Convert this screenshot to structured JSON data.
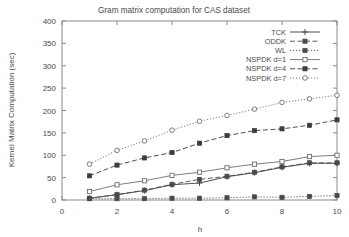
{
  "chart_data": {
    "type": "line",
    "title": "Gram matrix computation for CAS dataset",
    "xlabel": "h",
    "ylabel": "Kernel Matrix Computation (sec)",
    "xlim": [
      0,
      10
    ],
    "ylim": [
      0,
      400
    ],
    "xticks": [
      0,
      2,
      4,
      6,
      8,
      10
    ],
    "yticks": [
      0,
      50,
      100,
      150,
      200,
      250,
      300,
      350,
      400
    ],
    "xtick_labels": [
      "0",
      "2",
      "4",
      "6",
      "8",
      "10"
    ],
    "ytick_labels": [
      "0",
      "50",
      "100",
      "150",
      "200",
      "250",
      "300",
      "350",
      "400"
    ],
    "grid": false,
    "legend_position": "upper right inside",
    "x": [
      1,
      2,
      3,
      4,
      5,
      6,
      7,
      8,
      9,
      10
    ],
    "series": [
      {
        "name": "TCK",
        "marker": "plus",
        "line": "solid",
        "color": "#3c3c3c",
        "values": [
          4,
          12,
          21,
          34,
          38,
          52,
          61,
          73,
          82,
          82
        ]
      },
      {
        "name": "ODDK",
        "marker": "filled-square",
        "line": "dashed",
        "color": "#4a4a4a",
        "values": [
          4,
          12,
          22,
          35,
          46,
          53,
          62,
          74,
          83,
          83
        ]
      },
      {
        "name": "WL",
        "marker": "filled-square",
        "line": "dotted",
        "color": "#4a4a4a",
        "values": [
          3,
          3,
          3,
          4,
          4,
          5,
          7,
          6,
          8,
          10
        ]
      },
      {
        "name": "NSPDK d=1",
        "marker": "open-square",
        "line": "solid",
        "color": "#6e6e6e",
        "values": [
          19,
          34,
          43,
          55,
          62,
          72,
          80,
          86,
          97,
          100
        ]
      },
      {
        "name": "NSPDK d=4",
        "marker": "filled-square",
        "line": "dashed",
        "color": "#3c3c3c",
        "values": [
          54,
          78,
          94,
          106,
          127,
          144,
          155,
          159,
          167,
          179
        ]
      },
      {
        "name": "NSPDK d=7",
        "marker": "open-circle",
        "line": "dotted",
        "color": "#6e6e6e",
        "values": [
          80,
          111,
          132,
          156,
          176,
          189,
          203,
          218,
          226,
          234
        ]
      }
    ]
  }
}
